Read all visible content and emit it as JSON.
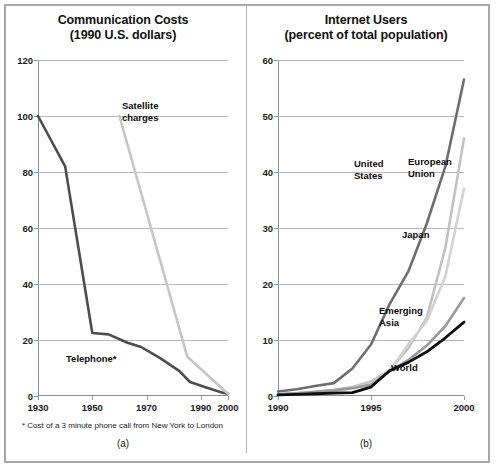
{
  "figure": {
    "width": 496,
    "height": 469,
    "background": "#ffffff",
    "frame_color": "#a8a8a8"
  },
  "panel_a": {
    "caption": "(a)",
    "title_line1": "Communication Costs",
    "title_line2": "(1990 U.S. dollars)",
    "footnote": "* Cost of a 3 minute phone call from New York to London",
    "labels": {
      "satellite_line1": "Satellite",
      "satellite_line2": "charges",
      "telephone": "Telephone*"
    },
    "yticks": [
      "0",
      "20",
      "40",
      "60",
      "80",
      "100",
      "120"
    ],
    "xticks": [
      "1930",
      "1950",
      "1970",
      "1990",
      "2000"
    ]
  },
  "panel_b": {
    "caption": "(b)",
    "title_line1": "Internet Users",
    "title_line2": "(percent of total population)",
    "labels": {
      "united_states_line1": "United",
      "united_states_line2": "States",
      "european_union_line1": "European",
      "european_union_line2": "Union",
      "japan": "Japan",
      "emerging_asia_line1": "Emerging",
      "emerging_asia_line2": "Asia",
      "world": "World"
    },
    "yticks": [
      "0",
      "10",
      "20",
      "30",
      "40",
      "50",
      "60"
    ],
    "xticks": [
      "1990",
      "1995",
      "2000"
    ]
  },
  "chart_data": [
    {
      "id": "communication-costs",
      "type": "line",
      "title": "Communication Costs (1990 U.S. dollars)",
      "subtitle": "(1990 U.S. dollars)",
      "xlabel": "",
      "ylabel": "1990 U.S. dollars",
      "xlim": [
        1930,
        2000
      ],
      "ylim": [
        0,
        120
      ],
      "xticks": [
        1930,
        1950,
        1970,
        1990,
        2000
      ],
      "yticks": [
        0,
        20,
        40,
        60,
        80,
        100,
        120
      ],
      "grid": "horizontal",
      "legend": "inline-annotations",
      "footnote": "* Cost of a 3 minute phone call from New York to London",
      "series": [
        {
          "name": "Telephone*",
          "color": "#4d4d4d",
          "width": 2.6,
          "x": [
            1930,
            1940,
            1950,
            1956,
            1963,
            1968,
            1975,
            1982,
            1986,
            1992,
            1998,
            2000
          ],
          "y": [
            100,
            82,
            22.5,
            22.0,
            19.0,
            17.5,
            13.5,
            9.0,
            5.0,
            3.0,
            1.2,
            0.8
          ]
        },
        {
          "name": "Satellite charges",
          "color": "#c6c6c6",
          "width": 2.6,
          "x": [
            1960,
            1985,
            2000
          ],
          "y": [
            100,
            14,
            0.8
          ]
        }
      ]
    },
    {
      "id": "internet-users",
      "type": "line",
      "title": "Internet Users (percent of total population)",
      "subtitle": "(percent of total population)",
      "xlabel": "",
      "ylabel": "percent of total population",
      "xlim": [
        1990,
        2000
      ],
      "ylim": [
        0,
        60
      ],
      "xticks": [
        1990,
        1995,
        2000
      ],
      "yticks": [
        0,
        10,
        20,
        30,
        40,
        50,
        60
      ],
      "grid": "horizontal",
      "legend": "inline-annotations",
      "series": [
        {
          "name": "United States",
          "color": "#6e6e6e",
          "width": 2.6,
          "x": [
            1990,
            1991,
            1992,
            1993,
            1994,
            1995,
            1996,
            1997,
            1998,
            1999,
            2000
          ],
          "y": [
            0.8,
            1.2,
            1.8,
            2.3,
            4.9,
            9.2,
            16.4,
            22.2,
            30.8,
            41.0,
            56.5
          ]
        },
        {
          "name": "European Union",
          "color": "#c2c2c2",
          "width": 2.6,
          "x": [
            1990,
            1991,
            1992,
            1993,
            1994,
            1995,
            1996,
            1997,
            1998,
            1999,
            2000
          ],
          "y": [
            0.3,
            0.5,
            0.8,
            1.1,
            1.6,
            2.6,
            4.6,
            8.5,
            14.0,
            26.5,
            46.0
          ]
        },
        {
          "name": "Japan",
          "color": "#d2d2d2",
          "width": 2.6,
          "x": [
            1990,
            1991,
            1992,
            1993,
            1994,
            1995,
            1996,
            1997,
            1998,
            1999,
            2000
          ],
          "y": [
            0.2,
            0.4,
            0.6,
            0.9,
            1.4,
            2.2,
            4.4,
            9.2,
            13.4,
            21.4,
            37.0
          ]
        },
        {
          "name": "Emerging Asia",
          "color": "#9a9a9a",
          "width": 2.6,
          "x": [
            1990,
            1991,
            1992,
            1993,
            1994,
            1995,
            1996,
            1997,
            1998,
            1999,
            2000
          ],
          "y": [
            0.3,
            0.5,
            0.7,
            1.0,
            1.4,
            2.0,
            4.4,
            6.4,
            9.0,
            12.5,
            17.5
          ]
        },
        {
          "name": "World",
          "color": "#0d0d0d",
          "width": 2.8,
          "x": [
            1990,
            1991,
            1992,
            1993,
            1994,
            1995,
            1996,
            1997,
            1998,
            1999,
            2000
          ],
          "y": [
            0.2,
            0.3,
            0.4,
            0.5,
            0.6,
            1.6,
            4.5,
            6.0,
            7.9,
            10.4,
            13.2
          ]
        }
      ]
    }
  ]
}
